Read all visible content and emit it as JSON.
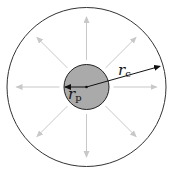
{
  "diagram": {
    "center": [
      86.5,
      87
    ],
    "outer_circle": {
      "radius": 79.5,
      "stroke": "#333333",
      "fill": "#ffffff"
    },
    "inner_circle": {
      "radius": 22.5,
      "stroke": "#222222",
      "fill": "#aaaaaa"
    },
    "radial_arrows": {
      "count": 8,
      "color": "#c8c8c8",
      "start_radius": 27,
      "end_radius": 70
    },
    "labels": {
      "rc": {
        "main": "r",
        "sub": "c"
      },
      "rp": {
        "main": "r",
        "sub": "p"
      }
    },
    "rc_line": {
      "from": [
        86.5,
        87
      ],
      "to": [
        161,
        66
      ],
      "color": "#111111"
    },
    "rp_line": {
      "from": [
        86.5,
        87
      ],
      "to": [
        64,
        87
      ],
      "color": "#111111"
    }
  }
}
